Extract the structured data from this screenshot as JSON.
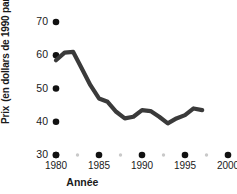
{
  "chart_data": {
    "type": "line",
    "title": "",
    "xlabel": "Année",
    "ylabel_main": "Prix",
    "ylabel_sub": "(en dollars de 1990 par tonne)",
    "xlim": [
      1979,
      2001
    ],
    "ylim": [
      30,
      72
    ],
    "grid": false,
    "legend": "none",
    "line_color": "#3a3a3a",
    "dot_color": "#111111",
    "minor_dot_color": "#c9c9c9",
    "x_ticks": [
      1980,
      1985,
      1990,
      1995,
      2000
    ],
    "x_tick_labels": [
      "1980",
      "1985",
      "1990",
      "1995",
      "2000"
    ],
    "x_minor_ticks": [
      1982.5,
      1987.5,
      1992.5,
      1997.5
    ],
    "y_ticks": [
      30,
      40,
      50,
      60,
      70
    ],
    "y_tick_labels": [
      "30",
      "40",
      "50",
      "60",
      "70"
    ],
    "series": [
      {
        "name": "Prix",
        "x": [
          1980,
          1981,
          1982,
          1983,
          1984,
          1985,
          1986,
          1987,
          1988,
          1989,
          1990,
          1991,
          1992,
          1993,
          1994,
          1995,
          1996,
          1997
        ],
        "values": [
          58.5,
          60.8,
          61.0,
          56.0,
          51.0,
          47.0,
          46.0,
          43.0,
          41.0,
          41.5,
          43.5,
          43.2,
          41.5,
          39.5,
          41.0,
          42.0,
          44.0,
          43.5
        ]
      }
    ]
  }
}
